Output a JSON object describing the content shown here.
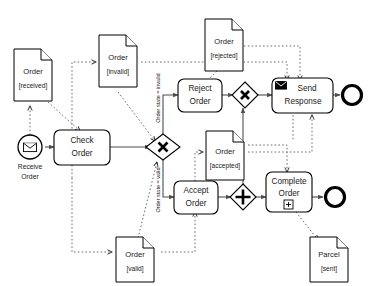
{
  "diagram": {
    "notation": "BPMN",
    "colors": {
      "shape_stroke": "#000000",
      "sequence_flow": "#4d4d4d",
      "association": "#6e6e6e",
      "background": "#ffffff"
    }
  },
  "events": {
    "start": {
      "id": "receive-order",
      "label_line1": "Receive",
      "label_line2": "Order",
      "type": "message-start-event",
      "icon": "envelope-open-icon"
    },
    "end_top": {
      "id": "end-event-response",
      "label": "",
      "type": "end-event"
    },
    "end_bottom": {
      "id": "end-event-complete",
      "label": "",
      "type": "end-event"
    }
  },
  "tasks": [
    {
      "id": "check-order",
      "line1": "Check",
      "line2": "Order",
      "marker": "none"
    },
    {
      "id": "reject-order",
      "line1": "Reject",
      "line2": "Order",
      "marker": "none"
    },
    {
      "id": "accept-order",
      "line1": "Accept",
      "line2": "Order",
      "marker": "none"
    },
    {
      "id": "send-response",
      "line1": "Send",
      "line2": "Response",
      "marker": "send-message",
      "icon": "envelope-closed-icon"
    },
    {
      "id": "complete-order",
      "line1": "Complete",
      "line2": "Order",
      "marker": "collapsed-subprocess",
      "icon": "plus-box-icon"
    }
  ],
  "gateways": [
    {
      "id": "split-xor",
      "type": "exclusive",
      "symbol": "X"
    },
    {
      "id": "merge-xor",
      "type": "exclusive",
      "symbol": "X"
    },
    {
      "id": "join-parallel",
      "type": "parallel",
      "symbol": "+"
    }
  ],
  "data_objects": [
    {
      "id": "order-received",
      "name": "Order",
      "state": "[received]"
    },
    {
      "id": "order-invalid",
      "name": "Order",
      "state": "[invalid]"
    },
    {
      "id": "order-rejected",
      "name": "Order",
      "state": "[rejected]"
    },
    {
      "id": "order-valid",
      "name": "Order",
      "state": "[valid]"
    },
    {
      "id": "order-accepted",
      "name": "Order",
      "state": "[accepted]"
    },
    {
      "id": "parcel-sent",
      "name": "Parcel",
      "state": "[sent]"
    }
  ],
  "flow_conditions": {
    "invalid_branch": "Order state = invalid",
    "valid_branch": "Order state = valid"
  }
}
